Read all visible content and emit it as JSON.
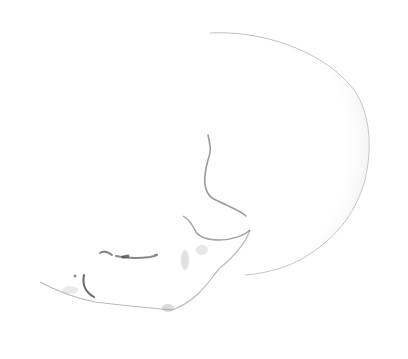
{
  "image": {
    "subject": "skull-lateral-view",
    "background_color": "#ffffff",
    "shading_color": "#9a9a9a",
    "line_color": "#6a6a6a"
  }
}
